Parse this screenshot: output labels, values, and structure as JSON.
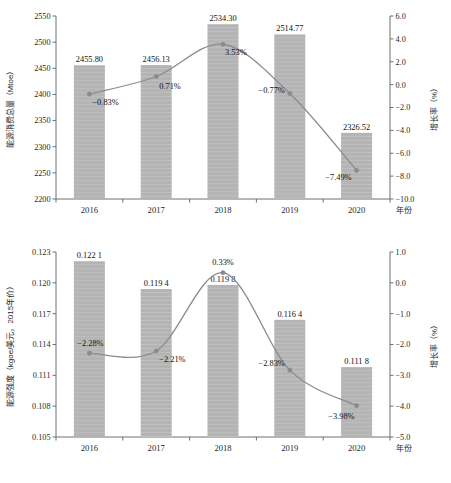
{
  "figure": {
    "background": "#ffffff",
    "bar_color": "#b4b4b4",
    "line_color": "#8c8c8c",
    "marker_color": "#8a8a8a",
    "axis_color": "#6f6f6f",
    "text_color": "#1f1f1f"
  },
  "chart_data": [
    {
      "type": "bar",
      "id": "top",
      "title": "",
      "xlabel": "年份",
      "ylabel": "能源消费总量（Mtoe）",
      "y2label": "增长率（%）",
      "categories": [
        "2016",
        "2017",
        "2018",
        "2019",
        "2020"
      ],
      "grid": false,
      "legend": "none",
      "ylim": [
        2200,
        2550
      ],
      "yticks": [
        "2200",
        "2250",
        "2300",
        "2350",
        "2400",
        "2450",
        "2500",
        "2550"
      ],
      "ytick_values": [
        2200,
        2250,
        2300,
        2350,
        2400,
        2450,
        2500,
        2550
      ],
      "y2lim": [
        -10.0,
        6.0
      ],
      "y2ticks": [
        "−10.0",
        "−8.0",
        "−6.0",
        "−4.0",
        "−2.0",
        "0.0",
        "2.0",
        "4.0",
        "6.0"
      ],
      "y2tick_values": [
        -10.0,
        -8.0,
        -6.0,
        -4.0,
        -2.0,
        0.0,
        2.0,
        4.0,
        6.0
      ],
      "series": [
        {
          "name": "能源消费总量（Mtoe）",
          "kind": "bar",
          "axis": "left",
          "values": [
            2455.8,
            2456.13,
            2534.3,
            2514.77,
            2326.52
          ],
          "labels": [
            "2455.80",
            "2456.13",
            "2534.30",
            "2514.77",
            "2326.52"
          ]
        },
        {
          "name": "增长率（%）",
          "kind": "line",
          "axis": "right",
          "values": [
            -0.83,
            0.71,
            3.53,
            -0.77,
            -7.49
          ],
          "labels": [
            "−0.83%",
            "0.71%",
            "3.53%",
            "−0.77%",
            "−7.49%"
          ]
        }
      ]
    },
    {
      "type": "bar",
      "id": "bottom",
      "title": "",
      "xlabel": "年份",
      "ylabel": "能源强度（kgoe/美元，2015年价）",
      "y2label": "增长率（%）",
      "categories": [
        "2016",
        "2017",
        "2018",
        "2019",
        "2020"
      ],
      "grid": false,
      "legend": "none",
      "ylim": [
        0.105,
        0.123
      ],
      "yticks": [
        "0.105",
        "0.108",
        "0.111",
        "0.114",
        "0.117",
        "0.120",
        "0.123"
      ],
      "ytick_values": [
        0.105,
        0.108,
        0.111,
        0.114,
        0.117,
        0.12,
        0.123
      ],
      "y2lim": [
        -5.0,
        1.0
      ],
      "y2ticks": [
        "−5.0",
        "−4.0",
        "−3.0",
        "−2.0",
        "−1.0",
        "0.0",
        "1.0"
      ],
      "y2tick_values": [
        -5.0,
        -4.0,
        -3.0,
        -2.0,
        -1.0,
        0.0,
        1.0
      ],
      "series": [
        {
          "name": "能源强度（kgoe/美元，2015年价）",
          "kind": "bar",
          "axis": "left",
          "values": [
            0.1221,
            0.1194,
            0.1198,
            0.1164,
            0.1118
          ],
          "labels": [
            "0.122 1",
            "0.119 4",
            "0.119 8",
            "0.116 4",
            "0.111 8"
          ]
        },
        {
          "name": "增长率（%）",
          "kind": "line",
          "axis": "right",
          "values": [
            -2.28,
            -2.21,
            0.33,
            -2.83,
            -3.98
          ],
          "labels": [
            "−2.28%",
            "−2.21%",
            "0.33%",
            "−2.83%",
            "−3.98%"
          ]
        }
      ]
    }
  ]
}
